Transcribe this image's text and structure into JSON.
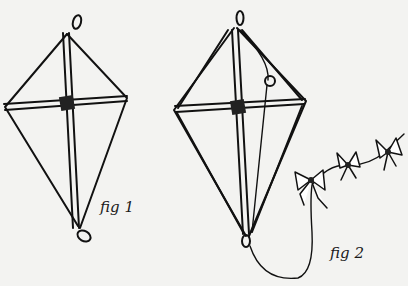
{
  "figures": [
    {
      "id": "fig1",
      "label": "fig 1",
      "description": "kite frame with cross sticks, loops at top and bottom"
    },
    {
      "id": "fig2",
      "label": "fig 2",
      "description": "kite with bridle string and bow-tail"
    }
  ],
  "colors": {
    "ink": "#111111",
    "paper": "#f3f3f1"
  }
}
